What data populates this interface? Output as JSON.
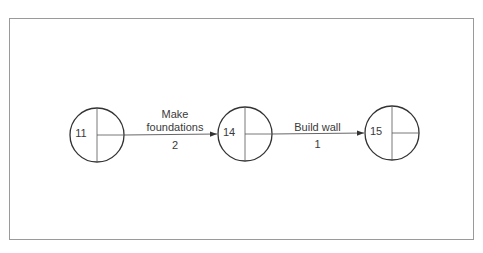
{
  "diagram": {
    "type": "activity-on-arrow network",
    "nodes": [
      {
        "id": "11",
        "label": "11",
        "cx": 97,
        "cy": 135
      },
      {
        "id": "14",
        "label": "14",
        "cx": 245,
        "cy": 134
      },
      {
        "id": "15",
        "label": "15",
        "cx": 392,
        "cy": 133
      }
    ],
    "activities": [
      {
        "from": "11",
        "to": "14",
        "name_line1": "Make",
        "name_line2": "foundations",
        "duration": "2"
      },
      {
        "from": "14",
        "to": "15",
        "name_line1": "Build wall",
        "duration": "1"
      }
    ],
    "colors": {
      "line": "#333333",
      "frame": "#9a9a9a"
    }
  }
}
